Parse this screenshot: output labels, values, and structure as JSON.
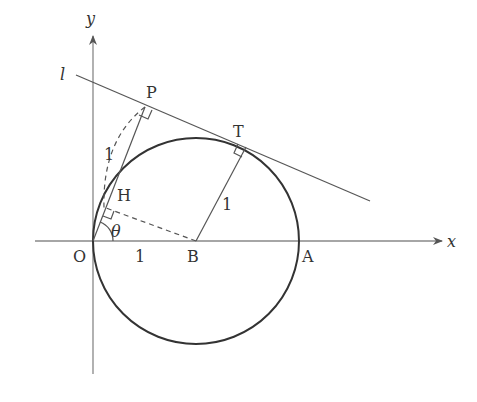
{
  "diagram": {
    "colors": {
      "axis": "#777777",
      "line": "#555555",
      "circle": "#333333",
      "text": "#333333"
    },
    "labels": {
      "x_axis": "x",
      "y_axis": "y",
      "line_l": "l",
      "origin": "O",
      "point_A": "A",
      "point_B": "B",
      "point_P": "P",
      "point_T": "T",
      "point_H": "H",
      "angle": "θ",
      "length_OB": "1",
      "length_HP": "1",
      "length_BT": "1"
    }
  }
}
